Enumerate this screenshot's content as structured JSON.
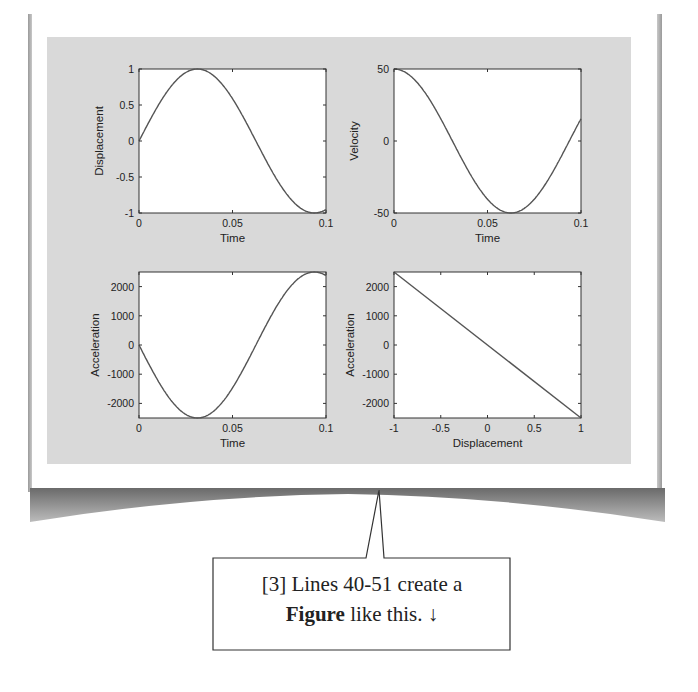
{
  "figure": {
    "background_color": "#d9d9d9",
    "axes_color": "#ffffff",
    "line_color": "#555555"
  },
  "callout": {
    "line1": "[3] Lines 40-51 create a",
    "bold_word": "Figure",
    "line2_rest": " like this.",
    "arrow": "↓"
  },
  "chart_data": [
    {
      "type": "line",
      "title": "",
      "xlabel": "Time",
      "ylabel": "Displacement",
      "xlim": [
        0,
        0.1
      ],
      "ylim": [
        -1,
        1
      ],
      "xticks": [
        "0",
        "0.05",
        "0.1"
      ],
      "yticks": [
        "1",
        "0.5",
        "0",
        "-0.5",
        "-1"
      ],
      "grid": false,
      "series": [
        {
          "name": "x(t) = sin(2π·8t)",
          "x": [
            0,
            0.01,
            0.02,
            0.03,
            0.04,
            0.05,
            0.06,
            0.07,
            0.08,
            0.09,
            0.1
          ],
          "values": [
            0,
            0.48,
            0.85,
            1.0,
            0.9,
            0.59,
            0.13,
            -0.37,
            -0.77,
            -0.98,
            -0.95
          ]
        }
      ]
    },
    {
      "type": "line",
      "title": "",
      "xlabel": "Time",
      "ylabel": "Velocity",
      "xlim": [
        0,
        0.1
      ],
      "ylim": [
        -50,
        50
      ],
      "xticks": [
        "0",
        "0.05",
        "0.1"
      ],
      "yticks": [
        "50",
        "0",
        "-50"
      ],
      "grid": false,
      "series": [
        {
          "name": "v(t)",
          "x": [
            0,
            0.01,
            0.02,
            0.03,
            0.04,
            0.05,
            0.06,
            0.07,
            0.08,
            0.09,
            0.1
          ],
          "values": [
            50,
            44,
            27,
            3,
            -21,
            -40,
            -50,
            -47,
            -32,
            -10,
            15
          ]
        }
      ]
    },
    {
      "type": "line",
      "title": "",
      "xlabel": "Time",
      "ylabel": "Acceleration",
      "xlim": [
        0,
        0.1
      ],
      "ylim": [
        -2500,
        2500
      ],
      "xticks": [
        "0",
        "0.05",
        "0.1"
      ],
      "yticks": [
        "2000",
        "1000",
        "0",
        "-1000",
        "-2000"
      ],
      "grid": false,
      "series": [
        {
          "name": "a(t)",
          "x": [
            0,
            0.01,
            0.02,
            0.03,
            0.04,
            0.05,
            0.06,
            0.07,
            0.08,
            0.09,
            0.1
          ],
          "values": [
            0,
            -1200,
            -2130,
            -2500,
            -2250,
            -1480,
            -320,
            920,
            1930,
            2450,
            2400
          ]
        }
      ]
    },
    {
      "type": "line",
      "title": "",
      "xlabel": "Displacement",
      "ylabel": "Acceleration",
      "xlim": [
        -1,
        1
      ],
      "ylim": [
        -2500,
        2500
      ],
      "xticks": [
        "-1",
        "-0.5",
        "0",
        "0.5",
        "1"
      ],
      "yticks": [
        "2000",
        "1000",
        "0",
        "-1000",
        "-2000"
      ],
      "grid": false,
      "series": [
        {
          "name": "a vs x",
          "x": [
            -1,
            1
          ],
          "values": [
            2500,
            -2500
          ]
        }
      ]
    }
  ]
}
